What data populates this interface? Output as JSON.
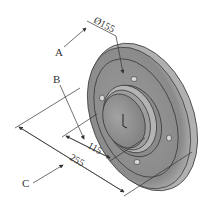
{
  "figure": {
    "type": "isometric technical drawing"
  },
  "labels": {
    "a": "A",
    "b": "B",
    "c": "C"
  },
  "dimensions": {
    "top_diameter": "Ø155",
    "inner": "115",
    "outer": "255"
  },
  "colors": {
    "line": "#333333",
    "disc_face": "#8e8e8e",
    "disc_rim": "#a8a8a8",
    "hub": "#9a9a9a",
    "background": "#ffffff"
  }
}
